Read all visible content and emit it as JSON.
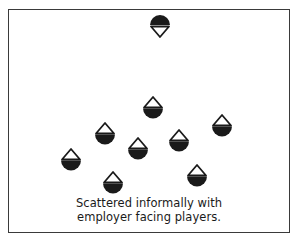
{
  "diagram": {
    "type": "formation-layout",
    "caption": {
      "line1": "Scattered informally with",
      "line2": "employer facing players."
    },
    "colors": {
      "frame": "#3a3a3a",
      "icon_fill": "#1a1a1a",
      "background": "#ffffff"
    },
    "legend_semantics": {
      "employer-icon": "dome on top, hollow triangle pointing down (facing players)",
      "player-icon": "hollow triangle pointing up, bowl below (facing employer)"
    },
    "employer": {
      "x": 160,
      "y": 15
    },
    "players": [
      {
        "x": 153,
        "y": 96
      },
      {
        "x": 105,
        "y": 122
      },
      {
        "x": 222,
        "y": 114
      },
      {
        "x": 138,
        "y": 137
      },
      {
        "x": 179,
        "y": 129
      },
      {
        "x": 71,
        "y": 148
      },
      {
        "x": 113,
        "y": 171
      },
      {
        "x": 197,
        "y": 164
      }
    ]
  }
}
